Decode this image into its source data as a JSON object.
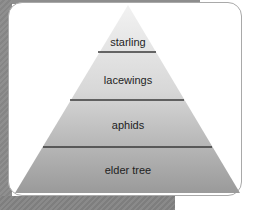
{
  "diagram": {
    "type": "food-pyramid",
    "levels": [
      {
        "label": "starling"
      },
      {
        "label": "lacewings"
      },
      {
        "label": "aphids"
      },
      {
        "label": "elder tree"
      }
    ]
  },
  "colors": {
    "top_fill": "#ededed",
    "bottom_fill": "#9e9e9e",
    "divider": "#3a3a3a",
    "card_border": "#a9a9a9",
    "background_gray": "#8a8a8a"
  }
}
